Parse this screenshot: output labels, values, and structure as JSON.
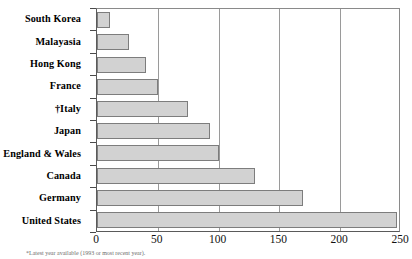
{
  "chart_data": {
    "type": "bar",
    "orientation": "horizontal",
    "title": "",
    "xlabel": "",
    "ylabel": "",
    "xlim": [
      0,
      250
    ],
    "xticks": [
      0,
      50,
      100,
      150,
      200,
      250
    ],
    "grid": true,
    "legend": null,
    "bar_color": "#d2d2d2",
    "bar_border_color": "#7d7d7d",
    "categories": [
      "South Korea",
      "Malayasia",
      "Hong Kong",
      "France",
      "†Italy",
      "Japan",
      "England & Wales",
      "Canada",
      "Germany",
      "United States"
    ],
    "values": [
      11,
      26,
      40,
      50,
      75,
      93,
      100,
      130,
      169,
      247
    ],
    "annotations": [
      "† dagger footnote marker on Italy"
    ]
  },
  "footnote": {
    "text": "*Latest year available (1993 or most recent year)."
  }
}
